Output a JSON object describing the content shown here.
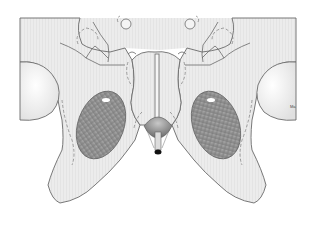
{
  "figure": {
    "colors": {
      "background": "#ffffff",
      "bone_fill": "#ececec",
      "bone_shade": "#e2e2e2",
      "outline": "#6a6a6a",
      "dashed": "#7a7a7a",
      "muscle_fill": "#9a9a9a",
      "muscle_dark": "#6e6e6e",
      "bulb_fill": "#8c8c8c",
      "tip": "#111111"
    },
    "corner_label": "Ma"
  }
}
